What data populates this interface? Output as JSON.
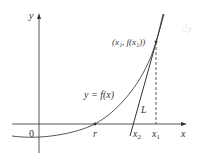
{
  "diagram": {
    "axes": {
      "x_label": "x",
      "y_label": "y",
      "origin_label": "0"
    },
    "curve": {
      "label": "y = f(x)"
    },
    "tangent_line": {
      "label": "L"
    },
    "points": {
      "root_label": "r",
      "x2_label_base": "x",
      "x2_label_sub": "2",
      "x1_label_base": "x",
      "x1_label_sub": "1",
      "tangent_point_label": "(x₁, f(x₁))"
    },
    "colors": {
      "stroke": "#333333",
      "background": "#ffffff"
    }
  }
}
